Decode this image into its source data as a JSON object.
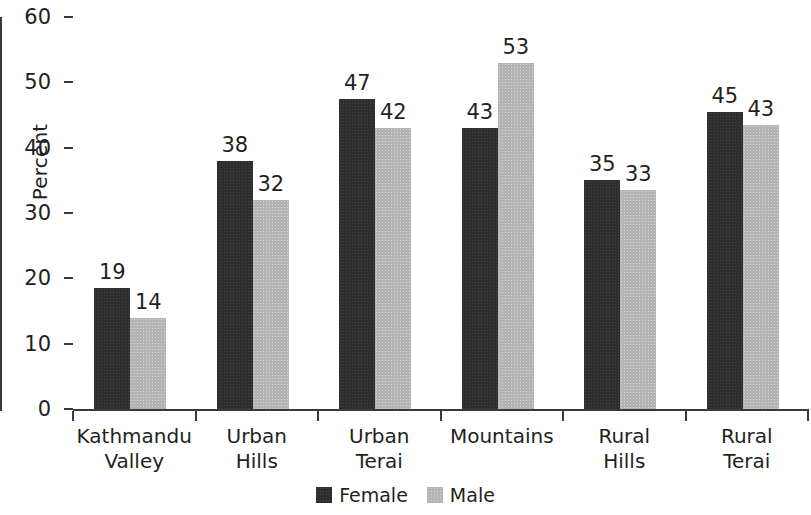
{
  "chart_data": {
    "type": "bar",
    "title": "",
    "subtitle": "",
    "xlabel": "",
    "ylabel": "Percent",
    "ylim": [
      0,
      60
    ],
    "yticks": [
      0,
      10,
      20,
      30,
      40,
      50,
      60
    ],
    "ytick_labels": [
      "0",
      "10",
      "20",
      "30",
      "40",
      "50",
      "60"
    ],
    "grid": false,
    "legend_position": "bottom-center",
    "categories": [
      "Kathmandu Valley",
      "Urban Hills",
      "Urban Terai",
      "Mountains",
      "Rural Hills",
      "Rural Terai"
    ],
    "category_lines": [
      [
        "Kathmandu",
        "Valley"
      ],
      [
        "Urban",
        "Hills"
      ],
      [
        "Urban",
        "Terai"
      ],
      [
        "Mountains"
      ],
      [
        "Rural",
        "Hills"
      ],
      [
        "Rural",
        "Terai"
      ]
    ],
    "series": [
      {
        "name": "Female",
        "color": "#2e2e2e",
        "values": [
          19,
          38,
          47,
          43,
          35,
          45
        ],
        "plotted": [
          18.5,
          38.0,
          47.5,
          43.0,
          35.0,
          45.5
        ],
        "labels": [
          "19",
          "38",
          "47",
          "43",
          "35",
          "45"
        ]
      },
      {
        "name": "Male",
        "color": "#b4b4b4",
        "values": [
          14,
          32,
          42,
          53,
          33,
          43
        ],
        "plotted": [
          14.0,
          32.0,
          43.0,
          53.0,
          33.5,
          43.5
        ],
        "labels": [
          "14",
          "32",
          "42",
          "53",
          "33",
          "43"
        ]
      }
    ]
  },
  "legend": {
    "items": [
      {
        "label": "Female",
        "swatch": "female"
      },
      {
        "label": "Male",
        "swatch": "male"
      }
    ]
  },
  "axis": {
    "y_title": "Percent"
  },
  "colors": {
    "female": "#2e2e2e",
    "male": "#b4b4b4",
    "axis": "#3a3a3a",
    "text": "#231f20",
    "background": "#ffffff"
  }
}
